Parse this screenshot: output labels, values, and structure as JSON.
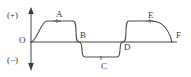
{
  "diagram": {
    "type": "transverse-wave",
    "title": "",
    "axes": {
      "vertical_axis_name": "amplitude-axis",
      "horizontal_axis_name": "distance-axis",
      "origin_label": "O",
      "positive_label": "(+)",
      "negative_label": "(−)",
      "vertical_arrow_both_ends": true,
      "horizontal_arrow": false
    },
    "points": [
      {
        "id": "A",
        "label": "A",
        "role": "crest",
        "x": 57,
        "y": 21
      },
      {
        "id": "B",
        "label": "B",
        "role": "zero-crossing-descending",
        "x": 79,
        "y": 42
      },
      {
        "id": "C",
        "label": "C",
        "role": "trough",
        "x": 101,
        "y": 57
      },
      {
        "id": "D",
        "label": "D",
        "role": "zero-crossing-ascending",
        "x": 123,
        "y": 42
      },
      {
        "id": "E",
        "label": "E",
        "role": "crest",
        "x": 150,
        "y": 21
      },
      {
        "id": "F",
        "label": "F",
        "role": "end-on-axis",
        "x": 172,
        "y": 42
      }
    ],
    "curve": {
      "name": "sine-wave-curve",
      "cycles": 2,
      "amplitude_px": 21,
      "baseline_y": 42,
      "start_x": 31,
      "end_x": 174,
      "stroke": "#4a4a4a",
      "stroke_width": 1.1
    },
    "markers": [
      {
        "name": "crest-tick-a",
        "x": 57,
        "y": 21
      },
      {
        "name": "crest-tick-e",
        "x": 150,
        "y": 21
      },
      {
        "name": "trough-tick-c",
        "x": 101,
        "y": 57
      }
    ],
    "colors": {
      "background": "#ffffff",
      "stroke": "#4a4a4a",
      "axis": "#444444",
      "text": "#3a3a3a"
    }
  }
}
